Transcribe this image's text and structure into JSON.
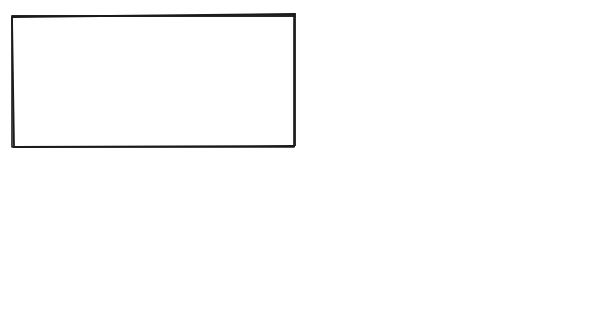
{
  "diagram": {
    "labels": {
      "weight": "Weight",
      "tie_cord": "Tie cord"
    },
    "panels": [
      {
        "id": "left",
        "caption_lines": [
          "Cord hangs",
          "slack; hook",
          "can't grab",
          "bad"
        ]
      },
      {
        "id": "right",
        "caption_lines": [
          "Cord hangs",
          "free so",
          "hook grabs",
          "good"
        ]
      }
    ],
    "colors": {
      "ink": "#1a1a1a",
      "background": "#ffffff"
    }
  }
}
